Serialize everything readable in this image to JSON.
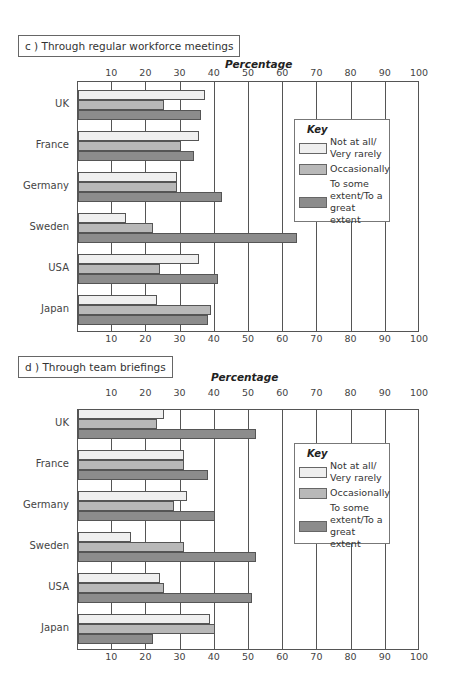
{
  "chart_data": [
    {
      "type": "bar",
      "orientation": "horizontal",
      "panel_label": "c ) Through regular workforce meetings",
      "title": "c ) Through regular workforce meetings",
      "xlabel": "Percentage",
      "ylabel": "",
      "xlim": [
        0,
        100
      ],
      "xticks": [
        10,
        20,
        30,
        40,
        50,
        60,
        70,
        80,
        90,
        100
      ],
      "grid": true,
      "legend_title": "Key",
      "legend_position": "right-inside",
      "categories": [
        "UK",
        "France",
        "Germany",
        "Sweden",
        "USA",
        "Japan"
      ],
      "series": [
        {
          "name": "Not at all/ Very rarely",
          "color": "#efefef",
          "values": [
            37,
            35.5,
            29,
            14,
            35.5,
            23
          ]
        },
        {
          "name": "Occasionally",
          "color": "#b8b8b8",
          "values": [
            25,
            30,
            29,
            22,
            24,
            39
          ]
        },
        {
          "name": "To some extent/To a great extent",
          "color": "#8c8c8c",
          "values": [
            36,
            34,
            42,
            64,
            41,
            38
          ]
        }
      ]
    },
    {
      "type": "bar",
      "orientation": "horizontal",
      "panel_label": "d ) Through team briefings",
      "title": "d ) Through team briefings",
      "xlabel": "Percentage",
      "ylabel": "",
      "xlim": [
        0,
        100
      ],
      "xticks": [
        10,
        20,
        30,
        40,
        50,
        60,
        70,
        80,
        90,
        100
      ],
      "grid": true,
      "legend_title": "Key",
      "legend_position": "right-inside",
      "categories": [
        "UK",
        "France",
        "Germany",
        "Sweden",
        "USA",
        "Japan"
      ],
      "series": [
        {
          "name": "Not at all/ Very rarely",
          "color": "#efefef",
          "values": [
            25,
            31,
            32,
            15.5,
            24,
            38.5
          ]
        },
        {
          "name": "Occasionally",
          "color": "#b8b8b8",
          "values": [
            23,
            31,
            28,
            31,
            25,
            40
          ]
        },
        {
          "name": "To some extent/To a great extent",
          "color": "#8c8c8c",
          "values": [
            52,
            38,
            40,
            52,
            51,
            22
          ]
        }
      ]
    }
  ],
  "panels": [
    {
      "title": "c ) Through regular workforce meetings",
      "axis_title": "Percentage",
      "key": {
        "title": "Key",
        "items": [
          "Not at all/ Very rarely",
          "Occasionally",
          "To some extent/To a great extent"
        ]
      }
    },
    {
      "title": "d ) Through team briefings",
      "axis_title": "Percentage",
      "key": {
        "title": "Key",
        "items": [
          "Not at all/ Very rarely",
          "Occasionally",
          "To some extent/To a great extent"
        ]
      }
    }
  ]
}
